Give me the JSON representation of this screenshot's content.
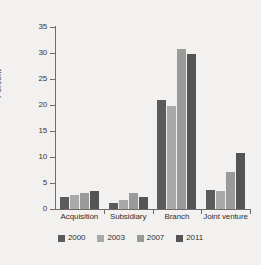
{
  "chart_data": {
    "type": "bar",
    "title": "",
    "xlabel": "",
    "ylabel": "Percent",
    "ylim": [
      0,
      35
    ],
    "yticks": [
      0,
      5,
      10,
      15,
      20,
      25,
      30,
      35
    ],
    "ytick_labels": [
      "0",
      "5",
      "10",
      "15",
      "20",
      "25",
      "30",
      "35"
    ],
    "grid": false,
    "legend_position": "bottom",
    "categories": [
      "Acquisition",
      "Subsidiary",
      "Branch",
      "Joint venture"
    ],
    "series": [
      {
        "name": "2000",
        "color": "#5b5b5b",
        "values": [
          2.3,
          1.1,
          21.0,
          3.7
        ]
      },
      {
        "name": "2003",
        "color": "#a9a9a7",
        "values": [
          2.7,
          1.8,
          19.8,
          3.5
        ]
      },
      {
        "name": "2007",
        "color": "#9a9a98",
        "values": [
          3.0,
          3.1,
          30.8,
          7.2
        ]
      },
      {
        "name": "2011",
        "color": "#545454",
        "values": [
          3.4,
          2.3,
          29.8,
          10.8
        ]
      }
    ]
  },
  "axes": {
    "y_title": "Percent"
  },
  "legend": {
    "entries": [
      {
        "label": "2000",
        "color": "#5b5b5b"
      },
      {
        "label": "2003",
        "color": "#a9a9a7"
      },
      {
        "label": "2007",
        "color": "#9a9a98"
      },
      {
        "label": "2011",
        "color": "#545454"
      }
    ]
  }
}
